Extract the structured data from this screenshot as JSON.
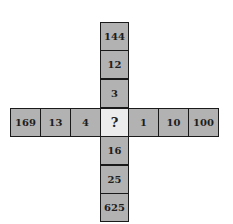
{
  "puzzle": {
    "vertical_top": [
      "144",
      "12",
      "3"
    ],
    "horizontal_left": [
      "169",
      "13",
      "4"
    ],
    "center": "?",
    "horizontal_right": [
      "1",
      "10",
      "100"
    ],
    "vertical_bottom": [
      "16",
      "25",
      "625"
    ]
  },
  "colors": {
    "cell_fill": "#b2b2b2",
    "center_fill": "#ececec",
    "border": "#1a1a1a"
  }
}
